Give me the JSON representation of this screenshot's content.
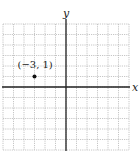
{
  "chart_data": {
    "type": "scatter",
    "title": "",
    "xlabel": "x",
    "ylabel": "y",
    "xlim": [
      -6,
      6
    ],
    "ylim": [
      -6,
      6
    ],
    "grid": true,
    "grid_step": 1,
    "points": [
      {
        "x": -3,
        "y": 1,
        "label": "(−3, 1)"
      }
    ]
  },
  "colors": {
    "grid": "#b8b8b8",
    "axis": "#222222",
    "point": "#111111",
    "text": "#222222"
  }
}
